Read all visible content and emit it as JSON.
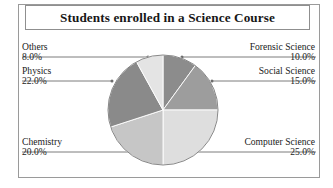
{
  "title": "Students enrolled in a Science Course",
  "chart_data": {
    "type": "pie",
    "title": "Students enrolled in a Science Course",
    "xlabel": "",
    "ylabel": "",
    "legend": "none",
    "grid": false,
    "value_format": "percent_one_decimal",
    "start_angle_deg": 0,
    "direction": "clockwise",
    "categories": [
      "Forensic Science",
      "Social Science",
      "Computer Science",
      "Chemistry",
      "Physics",
      "Others"
    ],
    "values": [
      10.0,
      15.0,
      25.0,
      20.0,
      22.0,
      8.0
    ],
    "total": 100.0,
    "slices": [
      {
        "label": "Forensic Science",
        "value": 10.0,
        "display": "10.0%",
        "color": "#8c8c8c",
        "label_side": "right"
      },
      {
        "label": "Social Science",
        "value": 15.0,
        "display": "15.0%",
        "color": "#9d9d9d",
        "label_side": "right"
      },
      {
        "label": "Computer Science",
        "value": 25.0,
        "display": "25.0%",
        "color": "#dedede",
        "label_side": "right"
      },
      {
        "label": "Chemistry",
        "value": 20.0,
        "display": "20.0%",
        "color": "#c6c6c6",
        "label_side": "left"
      },
      {
        "label": "Physics",
        "value": 22.0,
        "display": "22.0%",
        "color": "#8a8a8a",
        "label_side": "left"
      },
      {
        "label": "Others",
        "value": 8.0,
        "display": "8.0%",
        "color": "#e4e4e4",
        "label_side": "left"
      }
    ]
  },
  "labels": {
    "others": {
      "name": "Others",
      "percent": "8.0%"
    },
    "physics": {
      "name": "Physics",
      "percent": "22.0%"
    },
    "chemistry": {
      "name": "Chemistry",
      "percent": "20.0%"
    },
    "forensic_science": {
      "name": "Forensic Science",
      "percent": "10.0%"
    },
    "social_science": {
      "name": "Social Science",
      "percent": "15.0%"
    },
    "computer_science": {
      "name": "Computer Science",
      "percent": "25.0%"
    }
  }
}
